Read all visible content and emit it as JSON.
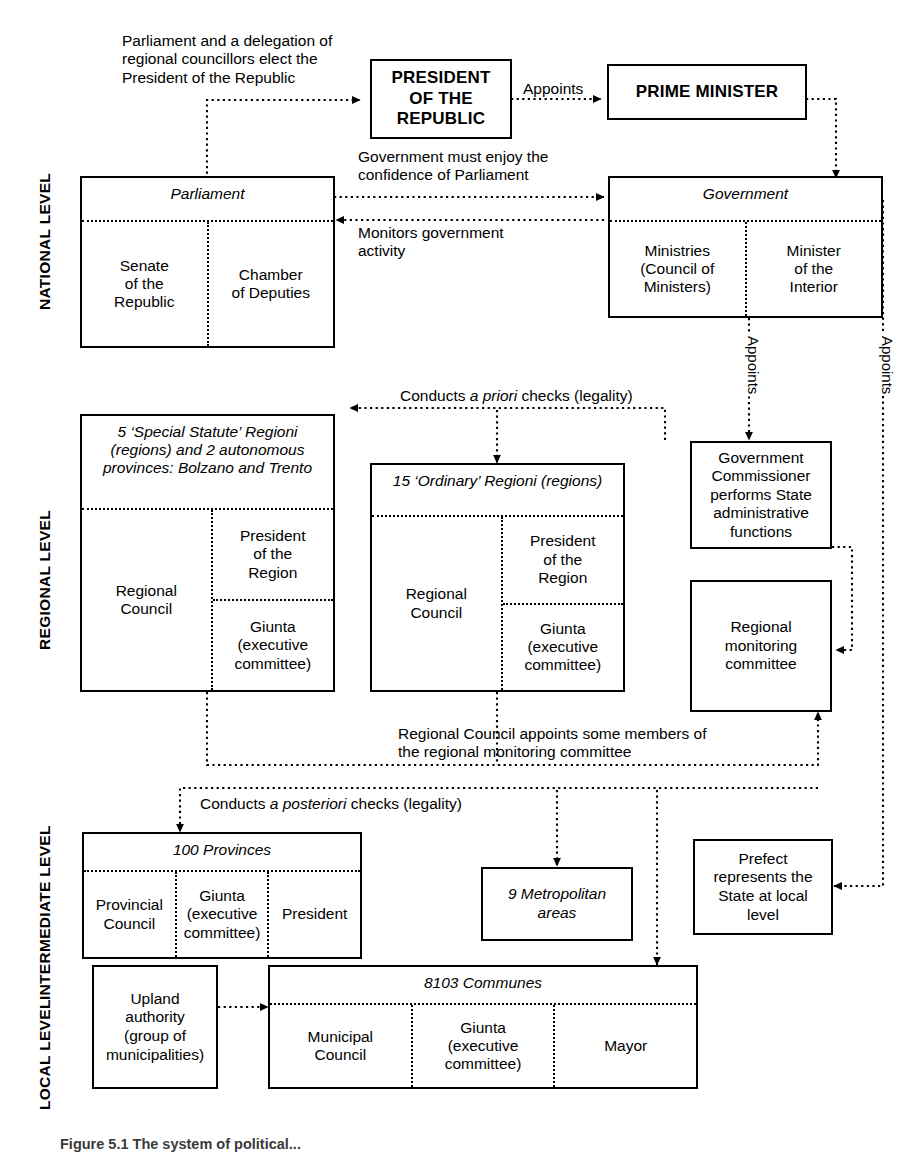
{
  "figure": {
    "caption": "Figure 5.1   The system of political..."
  },
  "levels": [
    {
      "id": "national",
      "label": "NATIONAL LEVEL"
    },
    {
      "id": "regional",
      "label": "REGIONAL LEVEL"
    },
    {
      "id": "intermediate",
      "label": "INTERMEDIATE LEVEL"
    },
    {
      "id": "local",
      "label": "LOCAL LEVEL"
    }
  ],
  "boxes": {
    "president": {
      "label": "PRESIDENT\nOF THE\nREPUBLIC"
    },
    "prime_minister": {
      "label": "PRIME MINISTER"
    },
    "parliament": {
      "title": "Parliament",
      "cells": [
        "Senate\nof the\nRepublic",
        "Chamber\nof Deputies"
      ]
    },
    "government": {
      "title": "Government",
      "cells": [
        "Ministries\n(Council of\nMinisters)",
        "Minister\nof the\nInterior"
      ]
    },
    "special_regions": {
      "title": "5 ‘Special Statute’ Regioni\n(regions) and 2 autonomous\nprovinces:\nBolzano and Trento",
      "left": "Regional\nCouncil",
      "right_top": "President\nof the\nRegion",
      "right_bottom": "Giunta\n(executive\ncommittee)"
    },
    "ordinary_regions": {
      "title": "15 ‘Ordinary’ Regioni\n(regions)",
      "left": "Regional\nCouncil",
      "right_top": "President\nof the\nRegion",
      "right_bottom": "Giunta\n(executive\ncommittee)"
    },
    "gov_commissioner": {
      "label": "Government\nCommissioner\nperforms State\nadministrative\nfunctions"
    },
    "regional_monitoring": {
      "label": "Regional\nmonitoring\ncommittee"
    },
    "provinces": {
      "title": "100 Provinces",
      "cells": [
        "Provincial\nCouncil",
        "Giunta\n(executive\ncommittee)",
        "President"
      ]
    },
    "metropolitan": {
      "label": "9  Metropolitan\nareas"
    },
    "prefect": {
      "label": "Prefect\nrepresents the\nState at local\nlevel"
    },
    "upland": {
      "label": "Upland\nauthority\n(group of\nmunicipalities)"
    },
    "communes": {
      "title": "8103 Communes",
      "cells": [
        "Municipal\nCouncil",
        "Giunta\n(executive\ncommittee)",
        "Mayor"
      ]
    }
  },
  "annotations": {
    "elect_president": "Parliament and a delegation of\nregional councillors elect the\nPresident of the Republic",
    "appoints_pm": "Appoints",
    "confidence": "Government must enjoy the\nconfidence of Parliament",
    "monitors": "Monitors government\nactivity",
    "appoints_commissioner": "Appoints",
    "appoints_prefect": "Appoints",
    "a_priori_pre": "Conducts ",
    "a_priori_em": "a priori",
    "a_priori_post": " checks (legality)",
    "council_appoints": "Regional Council appoints some members of\nthe regional monitoring committee",
    "a_posteriori_pre": "Conducts ",
    "a_posteriori_em": "a posteriori",
    "a_posteriori_post": " checks (legality)"
  },
  "colors": {
    "line": "#000000",
    "background": "#ffffff",
    "caption": "#3a3a3a"
  }
}
